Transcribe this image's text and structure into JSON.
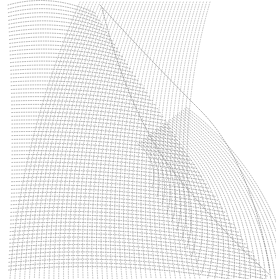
{
  "graphic": {
    "description": "Abstract dotted wave mesh",
    "background": "#ffffff",
    "dot_color": "#8a8a8a",
    "width": 276,
    "height": 279
  }
}
